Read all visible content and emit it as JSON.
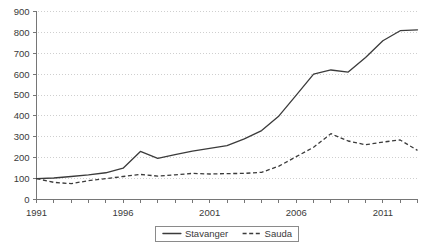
{
  "chart_data": {
    "type": "line",
    "title": "",
    "xlabel": "",
    "ylabel": "",
    "xlim": [
      1991,
      2013
    ],
    "ylim": [
      0,
      900
    ],
    "grid": true,
    "legend_position": "bottom",
    "x": [
      1991,
      1992,
      1993,
      1994,
      1995,
      1996,
      1997,
      1998,
      1999,
      2000,
      2001,
      2002,
      2003,
      2004,
      2005,
      2006,
      2007,
      2008,
      2009,
      2010,
      2011,
      2012,
      2013
    ],
    "xtick_labels": [
      "1991",
      "1996",
      "2001",
      "2006",
      "2011"
    ],
    "xticks": [
      1991,
      1996,
      2001,
      2006,
      2011
    ],
    "ytick_labels": [
      "0",
      "100",
      "200",
      "300",
      "400",
      "500",
      "600",
      "700",
      "800",
      "900"
    ],
    "yticks": [
      0,
      100,
      200,
      300,
      400,
      500,
      600,
      700,
      800,
      900
    ],
    "series": [
      {
        "name": "Stavanger",
        "style": "solid",
        "color": "#3b3b3b",
        "values": [
          100,
          103,
          110,
          118,
          128,
          150,
          230,
          197,
          215,
          232,
          245,
          258,
          290,
          330,
          400,
          500,
          600,
          620,
          610,
          680,
          760,
          808,
          812
        ]
      },
      {
        "name": "Sauda",
        "style": "dashed",
        "color": "#3b3b3b",
        "values": [
          100,
          82,
          76,
          90,
          100,
          110,
          120,
          112,
          118,
          125,
          122,
          124,
          125,
          130,
          160,
          205,
          250,
          315,
          280,
          262,
          275,
          285,
          235
        ]
      }
    ]
  },
  "legend": {
    "items": [
      {
        "label": "Stavanger",
        "style": "solid"
      },
      {
        "label": "Sauda",
        "style": "dashed"
      }
    ]
  }
}
